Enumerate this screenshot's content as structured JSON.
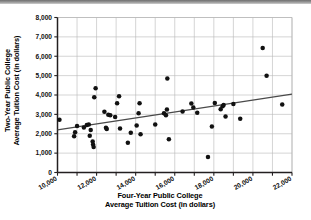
{
  "figure": {
    "kind": "scatter-plot-figure",
    "background": "#ffffff",
    "frame_color": "#231f20",
    "grid_color": "#b9b9b9",
    "point_color": "#111111",
    "trendline_color": "#4a4a4a"
  },
  "axis_titles": {
    "y_line1": "Two-Year Public College",
    "y_line2": "Average Tuition Cost (in dollars)",
    "x_line1": "Four-Year Public College",
    "x_line2": "Average Tuition Cost (in dollars)"
  },
  "chart_data": {
    "type": "scatter",
    "title": "",
    "xlabel": "Four-Year Public College Average Tuition Cost (in dollars)",
    "ylabel": "Two-Year Public College Average Tuition Cost (in dollars)",
    "xlim": [
      10000,
      22000
    ],
    "ylim": [
      0,
      8000
    ],
    "xticks": [
      10000,
      11000,
      12000,
      13000,
      14000,
      15000,
      16000,
      17000,
      18000,
      19000,
      20000,
      21000,
      22000
    ],
    "xtick_labels": [
      "10,000",
      "",
      "12,000",
      "",
      "14,000",
      "",
      "16,000",
      "",
      "18,000",
      "",
      "20,000",
      "",
      "22,000"
    ],
    "yticks": [
      0,
      1000,
      2000,
      3000,
      4000,
      5000,
      6000,
      7000,
      8000
    ],
    "ytick_labels": [
      "0",
      "1,000",
      "2,000",
      "3,000",
      "4,000",
      "5,000",
      "6,000",
      "7,000",
      "8,000"
    ],
    "xtick_label_rotation": -30,
    "grid": true,
    "grid_x_step": 1000,
    "grid_y_step": 1000,
    "legend": null,
    "points": [
      [
        10100,
        2720
      ],
      [
        10850,
        1870
      ],
      [
        10900,
        2080
      ],
      [
        11000,
        2400
      ],
      [
        11350,
        2320
      ],
      [
        11500,
        2450
      ],
      [
        11600,
        2480
      ],
      [
        11650,
        1900
      ],
      [
        11700,
        2200
      ],
      [
        11800,
        1600
      ],
      [
        11820,
        1450
      ],
      [
        11850,
        1320
      ],
      [
        11880,
        3880
      ],
      [
        11950,
        4350
      ],
      [
        12400,
        3130
      ],
      [
        12480,
        2310
      ],
      [
        12520,
        2250
      ],
      [
        12600,
        2980
      ],
      [
        12700,
        2950
      ],
      [
        12950,
        2870
      ],
      [
        13050,
        3580
      ],
      [
        13150,
        3930
      ],
      [
        13200,
        2270
      ],
      [
        13600,
        1540
      ],
      [
        13750,
        2050
      ],
      [
        14050,
        2430
      ],
      [
        14150,
        3060
      ],
      [
        14200,
        3580
      ],
      [
        14250,
        1980
      ],
      [
        15000,
        2480
      ],
      [
        15450,
        3060
      ],
      [
        15550,
        2950
      ],
      [
        15600,
        3250
      ],
      [
        15620,
        4850
      ],
      [
        15700,
        1710
      ],
      [
        16400,
        3150
      ],
      [
        16850,
        3560
      ],
      [
        16950,
        3350
      ],
      [
        17150,
        3080
      ],
      [
        17700,
        800
      ],
      [
        17900,
        2380
      ],
      [
        18050,
        3590
      ],
      [
        18350,
        3270
      ],
      [
        18450,
        3420
      ],
      [
        18500,
        3480
      ],
      [
        18600,
        2890
      ],
      [
        19000,
        3530
      ],
      [
        19350,
        2770
      ],
      [
        20500,
        6420
      ],
      [
        20700,
        4990
      ],
      [
        21500,
        3510
      ]
    ],
    "trendline": {
      "type": "linear-fit",
      "x_start": 10000,
      "y_start": 2200,
      "x_end": 22000,
      "y_end": 4050
    }
  }
}
